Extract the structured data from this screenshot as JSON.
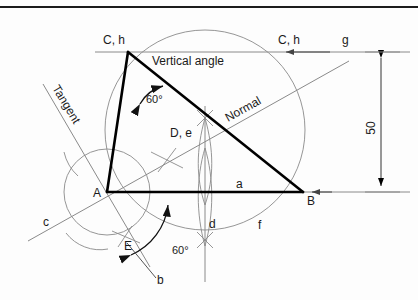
{
  "figure": {
    "title_note": "Triangle construction with circumscribed circle, tangent and normal",
    "stroke_heavy": "#000000",
    "stroke_light": "#8a8a8a",
    "background": "#fdfdfd"
  },
  "vertices": {
    "C": {
      "label": "C, h",
      "x": 128,
      "y": 52
    },
    "A": {
      "label": "A",
      "x": 107,
      "y": 192
    },
    "B": {
      "label": "B",
      "x": 303,
      "y": 192
    },
    "E": {
      "label": "E",
      "x": 127,
      "y": 243
    },
    "D": {
      "label": "D, e",
      "x": 180,
      "y": 137
    }
  },
  "labels": {
    "vertical_angle": "Vertical angle",
    "tangent": "Tangent",
    "normal": "Normal",
    "angle_top": "60°",
    "angle_bottom": "60°",
    "dimension_50": "50",
    "side_a": "a",
    "point_b": "b",
    "point_c": "c",
    "point_d": "d",
    "point_f": "f",
    "point_g": "g",
    "top_right_ch": "C, h",
    "top_left_ch": "C, h"
  },
  "dimension": {
    "value": "50",
    "from_y": 52,
    "to_y": 192,
    "x": 381
  },
  "geometry": {
    "circumcircle": {
      "cx": 205,
      "cy": 130,
      "r": 100
    },
    "arc_center_A_radius": 43,
    "triangle_sides": [
      "A-C",
      "C-B",
      "A-B"
    ],
    "angle_at_C_degrees": 60,
    "angle_at_A_below_degrees": 60
  }
}
